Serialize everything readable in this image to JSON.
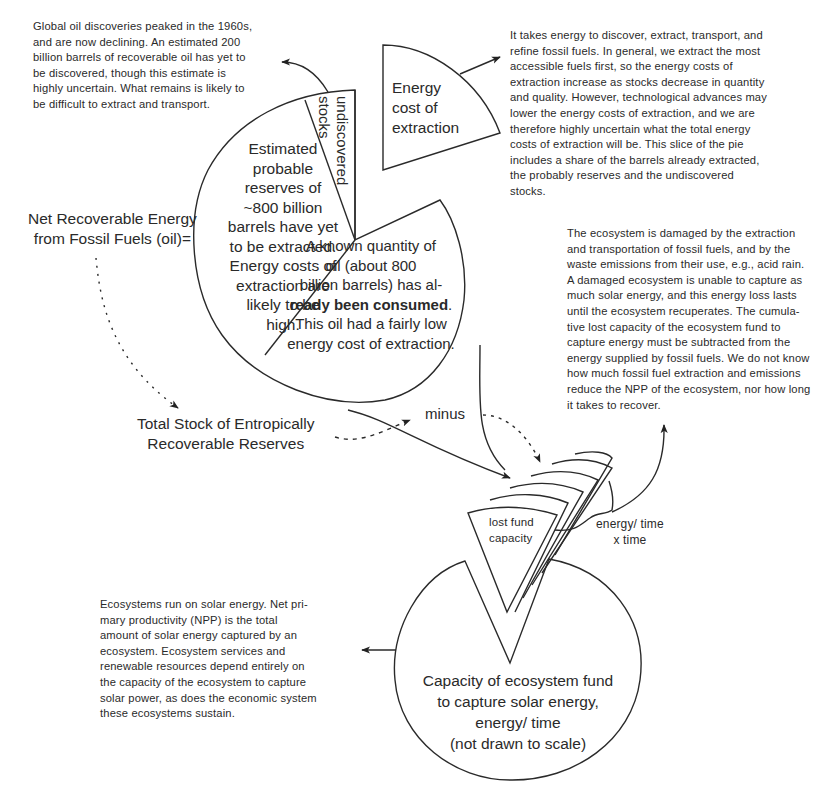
{
  "notes": {
    "discoveries": [
      "Global oil discoveries peaked in the 1960s,",
      "and are now declining.  An estimated 200",
      "billion barrels of recoverable oil has yet to",
      "be discovered, though this estimate is",
      "highly uncertain.  What remains is likely to",
      "be difficult to extract and transport."
    ],
    "energy_cost": [
      "It takes energy to discover, extract, transport, and",
      "refine fossil fuels. In general, we extract the most",
      "accessible fuels first, so the energy costs of",
      "extraction increase as stocks decrease in quantity",
      "and quality.  However, technological advances may",
      "lower the energy costs of extraction, and we are",
      "therefore highly uncertain what the total energy",
      "costs of extraction will be. This slice of the pie",
      "includes a share of the barrels already extracted,",
      "the probably reserves and the undiscovered",
      "stocks."
    ],
    "ecosystem_damage": [
      "The ecosystem is damaged by the extraction",
      "and transportation of fossil fuels, and by the",
      "waste emissions from their use, e.g.,  acid rain.",
      "A damaged ecosystem is unable to capture as",
      "much solar energy, and this energy loss lasts",
      "until the ecosystem recuperates.  The cumula-",
      "tive lost capacity of the ecosystem fund to",
      "capture energy must be subtracted from the",
      "energy supplied by fossil fuels. We do not know",
      "how much fossil fuel extraction and emissions",
      "reduce the NPP of the ecosystem, nor how long",
      "it takes to recover."
    ],
    "npp": [
      "Ecosystems run on solar energy.  Net pri-",
      "mary productivity (NPP) is the total",
      "amount of solar energy captured by an",
      "ecosystem.  Ecosystem services and",
      "renewable resources depend entirely on",
      "the capacity of the ecosystem to capture",
      "solar power, as does the economic system",
      "these ecosystems sustain."
    ]
  },
  "labels": {
    "net_recoverable": [
      "Net Recoverable Energy",
      "from Fossil Fuels (oil)="
    ],
    "total_stock": [
      "Total Stock of Entropically",
      "Recoverable Reserves"
    ],
    "minus": "minus",
    "energy_time": [
      "energy/ time",
      "x time"
    ],
    "lost_fund": [
      "lost fund",
      "capacity"
    ],
    "capacity_fund": [
      "Capacity of ecosystem fund",
      "to capture solar energy,",
      "energy/ time",
      "(not drawn to scale)"
    ]
  },
  "pie_slices": {
    "energy_cost": [
      "Energy",
      "cost of",
      "extraction"
    ],
    "undiscovered": "undiscovered",
    "stocks": "stocks",
    "probable_reserves": [
      "Estimated",
      "probable",
      "reserves of",
      "~800 billion",
      "barrels have yet",
      "to be extracted.",
      "Energy costs of",
      "extraction are",
      "likely to be",
      "high."
    ],
    "consumed": {
      "l1": "A known quantity of",
      "l2": "oil (about 800",
      "l3": "billion barrels) has al-",
      "l4_bold": "ready been consumed",
      "l4_tail": ".",
      "l5": "This oil had a fairly low",
      "l6": "energy cost of extraction."
    }
  }
}
